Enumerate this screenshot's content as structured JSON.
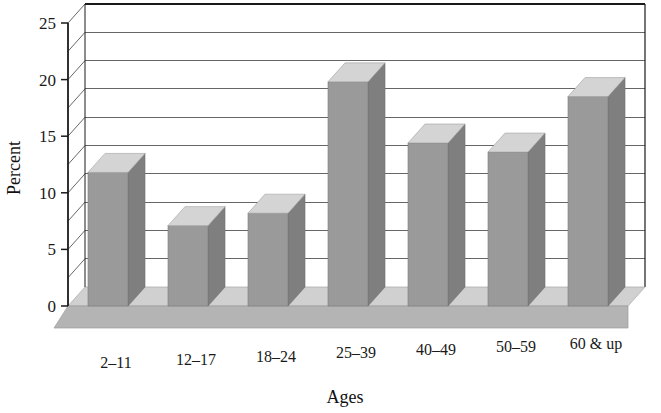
{
  "chart_data": {
    "type": "bar",
    "title": "",
    "subtitle": "",
    "xlabel": "Ages",
    "ylabel": "Percent",
    "categories": [
      "2–11",
      "12–17",
      "18–24",
      "25–39",
      "40–49",
      "50–59",
      "60 & up"
    ],
    "values": [
      11.8,
      7.1,
      8.2,
      19.8,
      14.4,
      13.6,
      18.5
    ],
    "ylim": [
      0,
      25
    ],
    "ytick_labels": [
      "0",
      "5",
      "10",
      "15",
      "20",
      "25"
    ],
    "ytick_values": [
      0,
      5,
      10,
      15,
      20,
      25
    ],
    "minor_gridline_values": [
      2.5,
      7.5,
      12.5,
      17.5,
      22.5
    ],
    "grid": true,
    "legend": "none",
    "style": "3d-column",
    "colors": {
      "bar_front": "#9a9a9a",
      "bar_top": "#d4d4d4",
      "bar_side": "#7f7f7f",
      "floor_top": "#d0d0d0",
      "floor_front": "#b4b4b4",
      "gridline": "#555555",
      "axis": "#1a1a1a",
      "text": "#1a1a1a",
      "background": "#ffffff"
    }
  },
  "axes": {
    "y_title": "Percent",
    "x_title": "Ages"
  }
}
